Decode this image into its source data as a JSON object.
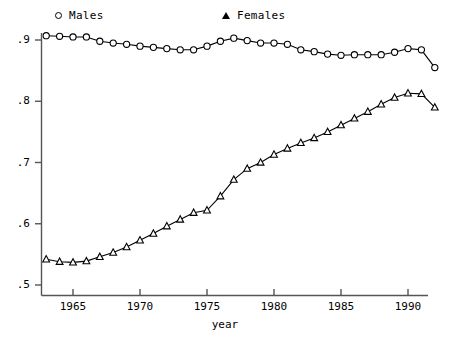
{
  "legend": {
    "position": "top",
    "entries": [
      {
        "label": "Males",
        "marker": "circle-icon"
      },
      {
        "label": "Females",
        "marker": "triangle-icon"
      }
    ]
  },
  "axes": {
    "y_ticks": [
      ".5",
      ".6",
      ".7",
      ".8",
      ".9"
    ],
    "x_ticks": [
      "1965",
      "1970",
      "1975",
      "1980",
      "1985",
      "1990"
    ],
    "xlabel": "year",
    "ylabel": ""
  },
  "chart_data": {
    "type": "line",
    "title": "",
    "subtitle": "",
    "xlabel": "year",
    "ylabel": "",
    "xlim": [
      1962.5,
      1992.5
    ],
    "ylim": [
      0.5,
      0.925
    ],
    "grid": false,
    "legend_position": "top",
    "x": [
      1963,
      1964,
      1965,
      1966,
      1967,
      1968,
      1969,
      1970,
      1971,
      1972,
      1973,
      1974,
      1975,
      1976,
      1977,
      1978,
      1979,
      1980,
      1981,
      1982,
      1983,
      1984,
      1985,
      1986,
      1987,
      1988,
      1989,
      1990,
      1991,
      1992
    ],
    "series": [
      {
        "name": "Males",
        "marker": "circle",
        "color": "#000000",
        "values": [
          0.907,
          0.906,
          0.905,
          0.905,
          0.898,
          0.895,
          0.893,
          0.89,
          0.888,
          0.886,
          0.884,
          0.884,
          0.89,
          0.898,
          0.903,
          0.899,
          0.895,
          0.895,
          0.893,
          0.884,
          0.881,
          0.877,
          0.875,
          0.876,
          0.876,
          0.876,
          0.88,
          0.886,
          0.884,
          0.855
        ]
      },
      {
        "name": "Females",
        "marker": "triangle",
        "color": "#000000",
        "values": [
          0.542,
          0.538,
          0.537,
          0.539,
          0.546,
          0.553,
          0.562,
          0.573,
          0.584,
          0.596,
          0.607,
          0.618,
          0.622,
          0.645,
          0.672,
          0.69,
          0.7,
          0.713,
          0.723,
          0.732,
          0.74,
          0.75,
          0.761,
          0.772,
          0.783,
          0.795,
          0.806,
          0.813,
          0.812,
          0.79
        ]
      }
    ]
  }
}
